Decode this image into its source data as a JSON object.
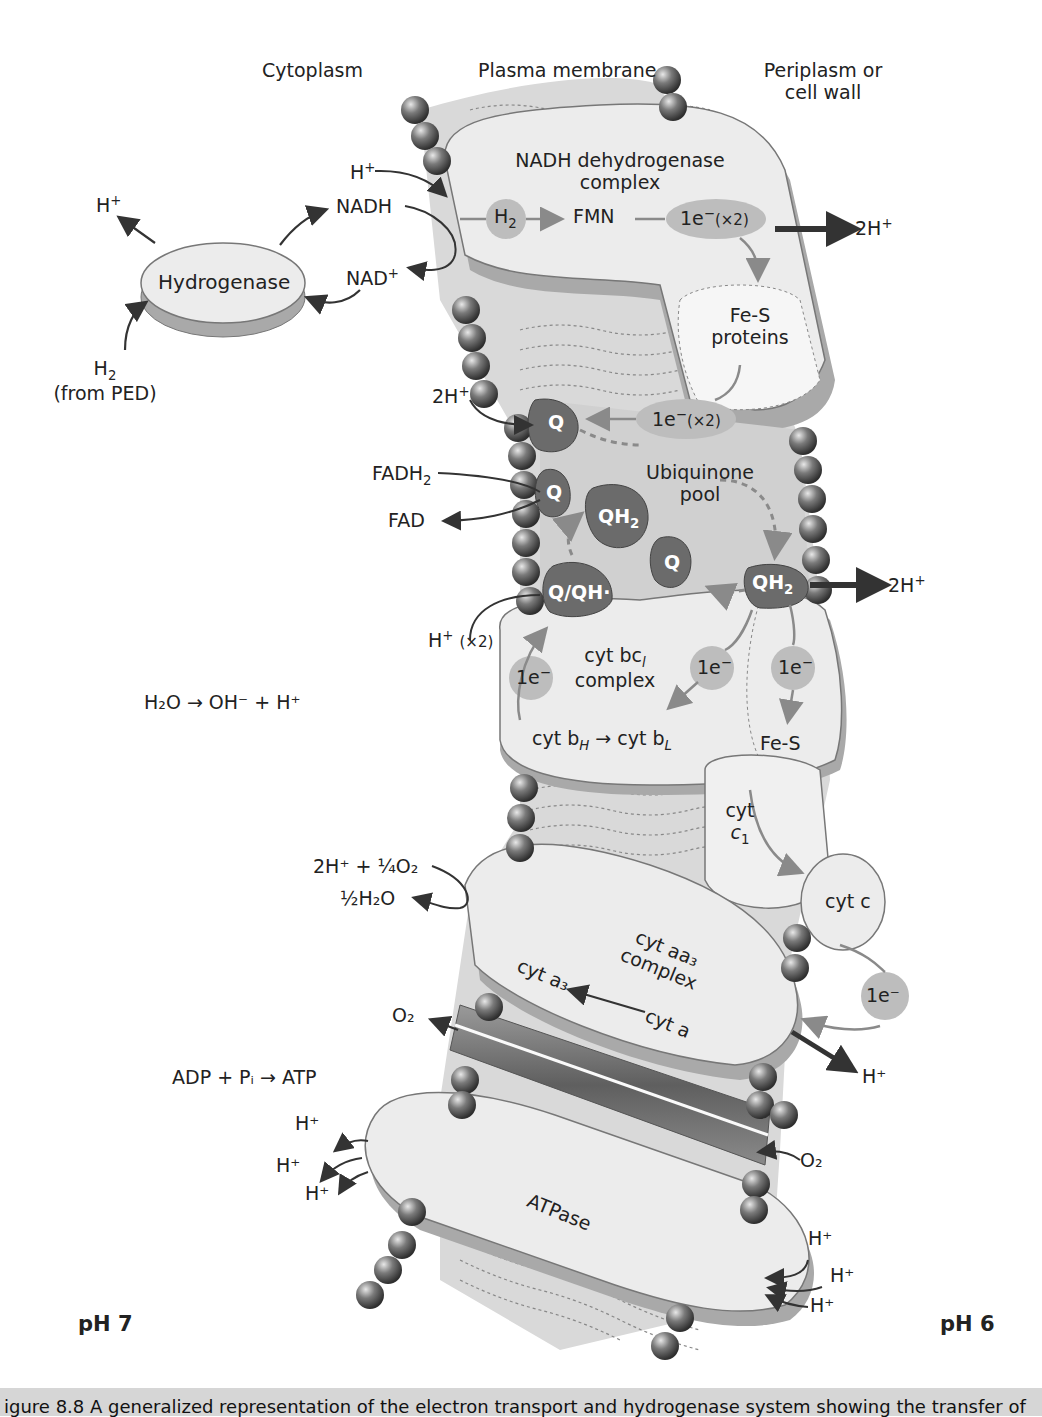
{
  "regions": {
    "cytoplasm": "Cytoplasm",
    "membrane": "Plasma membrane",
    "periplasm_line1": "Periplasm or",
    "periplasm_line2": "cell wall"
  },
  "hydrogenase": {
    "label": "Hydrogenase",
    "h_plus_out": "H",
    "h2_in": "H",
    "h2_source": "(from PED)"
  },
  "nadh": {
    "h_plus_in": "H",
    "nadh": "NADH",
    "nad_plus": "NAD",
    "complex_line1": "NADH dehydrogenase",
    "complex_line2": "complex",
    "h2_node": "H",
    "fmn": "FMN",
    "electron_node": "1e",
    "electron_mult": "(×2)",
    "pump_out": "2H"
  },
  "fes": {
    "line1": "Fe-S",
    "line2": "proteins",
    "electron_node": "1e",
    "electron_mult": "(×2)"
  },
  "ubiquinone": {
    "two_h_in": "2H",
    "q_top": "Q",
    "fadh2": "FADH",
    "fad": "FAD",
    "q_mid": "Q",
    "pool_line1": "Ubiquinone",
    "pool_line2": "pool",
    "qh2_left": "QH",
    "q_center": "Q",
    "q_qh": "Q/QH·",
    "qh2_right": "QH",
    "pump_out": "2H",
    "h_in": "H",
    "h_in_mult": "(×2)"
  },
  "bc1": {
    "line1": "cyt bc",
    "line2": "complex",
    "e_left": "1e",
    "e_mid": "1e",
    "e_right": "1e",
    "cyt_bh": "cyt b",
    "cyt_bl": "cyt b",
    "fes": "Fe-S",
    "cyt_c1_line1": "cyt",
    "cyt_c1_line2": "c"
  },
  "water": {
    "equation": "H₂O → OH⁻ + H⁺"
  },
  "oxidase": {
    "reactants": "2H⁺ + ¼O₂",
    "product": "½H₂O",
    "cyt_c": "cyt c",
    "line1": "cyt aa₃",
    "line2": "complex",
    "cyt_a3": "cyt a₃",
    "cyt_a": "cyt a",
    "electron_node": "1e⁻",
    "o2_out": "O₂",
    "h_out": "H⁺"
  },
  "atpase": {
    "equation": "ADP + Pᵢ → ATP",
    "label": "ATPase",
    "h_left": [
      "H⁺",
      "H⁺",
      "H⁺"
    ],
    "h_right": [
      "H⁺",
      "H⁺",
      "H⁺"
    ],
    "o2_in": "O₂"
  },
  "ph": {
    "left": "pH 7",
    "right": "pH 6"
  },
  "caption": {
    "text": "igure 8.8  A generalized representation of the electron transport and hydrogenase system showing the transfer of"
  },
  "colors": {
    "protein_fill": "#ececec",
    "protein_shadow": "#a9a9a9",
    "membrane_fill": "#cfcfcf",
    "lipid_head": "#5a5a5a",
    "quinone": "#6b6b6b",
    "electron_node": "#bdbdbd",
    "arrow_dark": "#333333",
    "arrow_grey": "#8a8a8a",
    "caption_bg": "#d6d6d6"
  }
}
